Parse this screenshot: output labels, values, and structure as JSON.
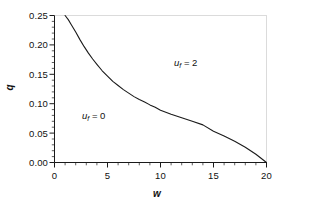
{
  "chart_data": {
    "type": "line",
    "title": "",
    "xlabel": "w",
    "ylabel": "q",
    "xlim": [
      0,
      20
    ],
    "ylim": [
      0.0,
      0.25
    ],
    "grid": false,
    "legend_position": "none",
    "x_ticks": [
      "0",
      "5",
      "10",
      "15",
      "20"
    ],
    "x_tick_values": [
      0,
      5,
      10,
      15,
      20
    ],
    "y_ticks": [
      "0.00",
      "0.05",
      "0.10",
      "0.15",
      "0.20",
      "0.25"
    ],
    "y_tick_values": [
      0.0,
      0.05,
      0.1,
      0.15,
      0.2,
      0.25
    ],
    "x_minor_tick_interval": 1,
    "y_minor_tick_interval": 0.01,
    "series": [
      {
        "name": "boundary",
        "color": "#1a1a1a",
        "linewidth": 1.1,
        "x": [
          1.0,
          1.3,
          1.6,
          2.0,
          2.4,
          2.8,
          3.2,
          3.6,
          4.0,
          4.5,
          5.0,
          5.5,
          6.0,
          6.5,
          7.0,
          7.5,
          8.0,
          8.5,
          9.0,
          9.5,
          10.0,
          11.0,
          12.0,
          13.0,
          14.0,
          15.0,
          16.0,
          17.0,
          18.0,
          19.0,
          20.0
        ],
        "y": [
          0.25,
          0.243,
          0.234,
          0.222,
          0.209,
          0.197,
          0.186,
          0.176,
          0.167,
          0.156,
          0.147,
          0.138,
          0.131,
          0.124,
          0.118,
          0.112,
          0.107,
          0.103,
          0.098,
          0.094,
          0.089,
          0.082,
          0.076,
          0.07,
          0.064,
          0.053,
          0.045,
          0.036,
          0.026,
          0.014,
          0.0
        ]
      }
    ],
    "annotations": [
      {
        "id": "annot-upper",
        "text": "u_f = 2",
        "var": "u",
        "sub": "f",
        "rest": " = 2",
        "x": 12.0,
        "y": 0.183
      },
      {
        "id": "annot-lower",
        "text": "u_f = 0",
        "var": "u",
        "sub": "f",
        "rest": " = 0",
        "x": 3.4,
        "y": 0.092
      }
    ],
    "colors": {
      "background": "#ffffff",
      "line": "#1a1a1a",
      "axis": "#1a1a1a",
      "text": "#111111"
    }
  },
  "axes": {
    "x_title": "w",
    "y_title": "q"
  },
  "tick_labels": {
    "y": [
      "0.25",
      "0.20",
      "0.15",
      "0.10",
      "0.05",
      "0.00"
    ],
    "x": [
      "0",
      "5",
      "10",
      "15",
      "20"
    ]
  }
}
